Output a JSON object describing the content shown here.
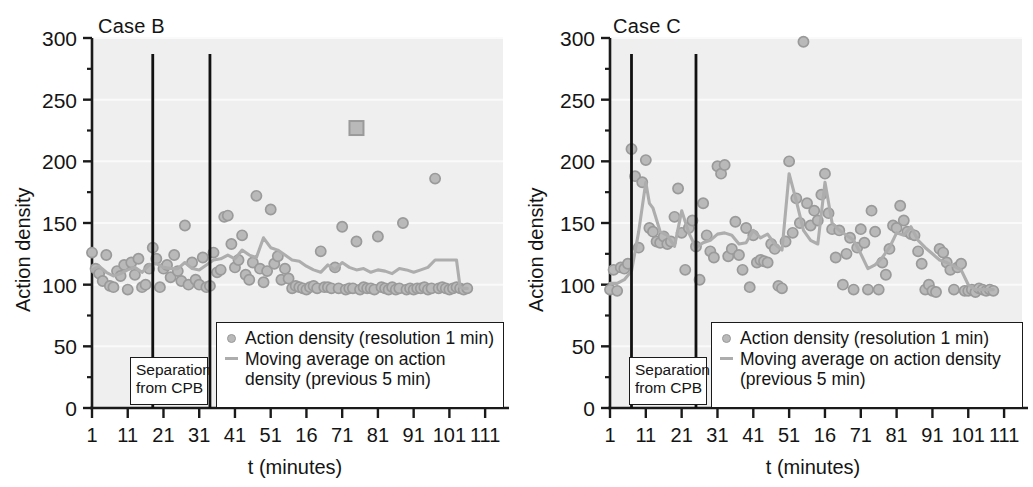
{
  "figure": {
    "background": "#ffffff",
    "marker_color": "#b9b9b9",
    "marker_edge_color": "#9a9a9a",
    "line_color": "#adadad",
    "axis_color": "#1a1a1a",
    "plot_bg": "#efefef"
  },
  "axis": {
    "y_label": "Action density",
    "x_label": "t (minutes)",
    "y_ticks": [
      "0",
      "50",
      "100",
      "150",
      "200",
      "250",
      "300"
    ],
    "y_tick_values": [
      0,
      50,
      100,
      150,
      200,
      250,
      300
    ],
    "y_minor_values": [
      25,
      75,
      125,
      175,
      225,
      275
    ],
    "x_ticks": [
      "1",
      "11",
      "21",
      "31",
      "41",
      "51",
      "16",
      "71",
      "81",
      "91",
      "101",
      "111"
    ],
    "x_tick_values": [
      1,
      11,
      21,
      31,
      41,
      51,
      61,
      71,
      81,
      91,
      101,
      111
    ]
  },
  "legend": {
    "scatter_label": "Action density (resolution 1 min)",
    "line_label_b_line1": "Moving average on action",
    "line_label_b_line2": "density (previous 5 min)",
    "line_label_c_line1": "Moving average on action density",
    "line_label_c_line2": "(previous 5 min)",
    "scatter_marker": "circle-marker-icon",
    "line_marker": "line-marker-icon"
  },
  "annotations": {
    "separation_line1": "Separation",
    "separation_line2": "from CPB"
  },
  "panels": [
    {
      "id": "b",
      "title": "Case B"
    },
    {
      "id": "c",
      "title": "Case C"
    }
  ],
  "chart_data": [
    {
      "type": "scatter",
      "title": "Case B",
      "xlabel": "t (minutes)",
      "ylabel": "Action density",
      "xlim": [
        1,
        116
      ],
      "ylim": [
        0,
        300
      ],
      "grid": false,
      "legend_position": "lower-right-inside",
      "annotations": [
        {
          "text": "Separation from CPB",
          "type": "vline-pair",
          "x": [
            18,
            34
          ]
        }
      ],
      "series": [
        {
          "name": "Action density (resolution 1 min)",
          "type": "scatter",
          "marker": "circle",
          "x": [
            1,
            2,
            3,
            4,
            5,
            6,
            7,
            8,
            9,
            10,
            11,
            12,
            13,
            14,
            15,
            16,
            17,
            18,
            19,
            20,
            21,
            22,
            23,
            24,
            25,
            26,
            27,
            28,
            29,
            30,
            31,
            32,
            33,
            34,
            35,
            36,
            37,
            38,
            39,
            40,
            41,
            42,
            43,
            44,
            45,
            46,
            47,
            48,
            49,
            50,
            51,
            52,
            53,
            54,
            55,
            56,
            57,
            58,
            59,
            60,
            61,
            62,
            63,
            64,
            65,
            66,
            67,
            68,
            69,
            70,
            71,
            72,
            73,
            74,
            75,
            76,
            77,
            78,
            79,
            80,
            81,
            82,
            83,
            84,
            85,
            86,
            87,
            88,
            89,
            90,
            91,
            92,
            93,
            94,
            95,
            96,
            97,
            98,
            99,
            100,
            101,
            102,
            103,
            104,
            105,
            106
          ],
          "y": [
            126,
            113,
            109,
            103,
            124,
            99,
            98,
            111,
            107,
            116,
            96,
            118,
            108,
            121,
            98,
            100,
            113,
            130,
            121,
            98,
            113,
            116,
            106,
            124,
            111,
            103,
            148,
            100,
            118,
            104,
            100,
            122,
            98,
            99,
            126,
            110,
            112,
            155,
            156,
            133,
            114,
            120,
            140,
            108,
            104,
            118,
            172,
            113,
            102,
            111,
            161,
            117,
            123,
            104,
            113,
            105,
            97,
            99,
            98,
            97,
            96,
            98,
            99,
            97,
            127,
            98,
            98,
            97,
            114,
            97,
            147,
            96,
            97,
            97,
            135,
            96,
            98,
            97,
            97,
            96,
            139,
            98,
            97,
            96,
            98,
            96,
            97,
            150,
            96,
            97,
            96,
            97,
            97,
            98,
            96,
            97,
            186,
            97,
            98,
            97,
            96,
            97,
            98,
            97,
            96,
            97
          ]
        },
        {
          "name": "Action density outlier (square marker)",
          "type": "scatter",
          "marker": "square",
          "x": [
            75
          ],
          "y": [
            227
          ]
        },
        {
          "name": "Moving average on action density (previous 5 min)",
          "type": "line",
          "x": [
            1,
            3,
            5,
            7,
            9,
            11,
            13,
            15,
            17,
            19,
            21,
            23,
            25,
            27,
            29,
            31,
            33,
            35,
            37,
            39,
            41,
            43,
            45,
            47,
            49,
            51,
            53,
            55,
            57,
            59,
            61,
            63,
            65,
            67,
            69,
            71,
            73,
            75,
            77,
            79,
            81,
            83,
            85,
            87,
            89,
            91,
            93,
            95,
            97,
            99,
            101,
            103,
            104,
            105,
            106
          ],
          "y": [
            112,
            115,
            110,
            107,
            109,
            112,
            114,
            110,
            116,
            117,
            114,
            113,
            113,
            118,
            113,
            112,
            116,
            120,
            121,
            124,
            121,
            128,
            124,
            122,
            138,
            130,
            128,
            124,
            120,
            119,
            115,
            112,
            110,
            116,
            112,
            118,
            114,
            112,
            113,
            110,
            112,
            111,
            109,
            113,
            112,
            110,
            112,
            114,
            120,
            120,
            120,
            120,
            98,
            97,
            97
          ]
        }
      ]
    },
    {
      "type": "scatter",
      "title": "Case C",
      "xlabel": "t (minutes)",
      "ylabel": "Action density",
      "xlim": [
        1,
        116
      ],
      "ylim": [
        0,
        300
      ],
      "grid": false,
      "legend_position": "lower-right-inside",
      "annotations": [
        {
          "text": "Separation from CPB",
          "type": "vline-pair",
          "x": [
            7,
            25
          ]
        }
      ],
      "series": [
        {
          "name": "Action density (resolution 1 min)",
          "type": "scatter",
          "marker": "circle",
          "x": [
            1,
            2,
            3,
            4,
            5,
            6,
            7,
            8,
            9,
            10,
            11,
            12,
            13,
            14,
            15,
            16,
            17,
            18,
            19,
            20,
            21,
            22,
            23,
            24,
            25,
            26,
            27,
            28,
            29,
            30,
            31,
            32,
            33,
            34,
            35,
            36,
            37,
            38,
            39,
            40,
            41,
            42,
            43,
            44,
            45,
            46,
            47,
            48,
            49,
            50,
            51,
            52,
            53,
            54,
            55,
            56,
            57,
            58,
            59,
            60,
            61,
            62,
            63,
            64,
            65,
            66,
            67,
            68,
            69,
            70,
            71,
            72,
            73,
            74,
            75,
            76,
            77,
            78,
            79,
            80,
            81,
            82,
            83,
            84,
            85,
            86,
            87,
            88,
            89,
            90,
            91,
            92,
            93,
            94,
            95,
            96,
            97,
            98,
            99,
            100,
            101,
            102,
            103,
            104,
            105,
            106,
            107,
            108
          ],
          "y": [
            96,
            112,
            95,
            114,
            113,
            117,
            210,
            188,
            130,
            183,
            201,
            146,
            143,
            135,
            134,
            139,
            133,
            135,
            155,
            178,
            142,
            112,
            146,
            152,
            131,
            104,
            166,
            140,
            127,
            122,
            196,
            190,
            197,
            123,
            129,
            151,
            124,
            112,
            146,
            98,
            140,
            118,
            120,
            119,
            118,
            133,
            129,
            99,
            97,
            135,
            200,
            142,
            170,
            150,
            297,
            166,
            148,
            160,
            152,
            173,
            190,
            158,
            145,
            122,
            144,
            100,
            125,
            138,
            96,
            130,
            145,
            134,
            96,
            160,
            143,
            96,
            118,
            108,
            129,
            148,
            146,
            164,
            152,
            143,
            141,
            140,
            127,
            117,
            96,
            100,
            95,
            94,
            129,
            126,
            118,
            112,
            96,
            114,
            117,
            95,
            95,
            96,
            94,
            97,
            96,
            95,
            96,
            95
          ]
        },
        {
          "name": "Moving average on action density (previous 5 min)",
          "type": "line",
          "x": [
            1,
            3,
            5,
            7,
            9,
            11,
            12,
            13,
            15,
            17,
            19,
            21,
            23,
            25,
            27,
            29,
            31,
            33,
            35,
            37,
            39,
            41,
            43,
            45,
            47,
            49,
            51,
            53,
            55,
            57,
            59,
            61,
            63,
            65,
            67,
            69,
            71,
            73,
            75,
            77,
            79,
            81,
            83,
            85,
            87,
            89,
            91,
            93,
            95,
            97,
            99,
            101,
            103,
            105,
            107,
            108
          ],
          "y": [
            101,
            101,
            104,
            111,
            143,
            183,
            166,
            162,
            143,
            140,
            131,
            160,
            142,
            130,
            134,
            136,
            141,
            142,
            140,
            133,
            134,
            144,
            138,
            141,
            133,
            128,
            190,
            168,
            144,
            136,
            133,
            183,
            150,
            144,
            140,
            136,
            125,
            113,
            116,
            122,
            130,
            142,
            140,
            147,
            136,
            130,
            125,
            120,
            118,
            115,
            112,
            100,
            96,
            96,
            96,
            96
          ]
        }
      ]
    }
  ]
}
